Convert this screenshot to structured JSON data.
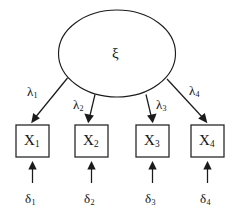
{
  "diagram": {
    "type": "path-diagram",
    "background_color": "#ffffff",
    "stroke_color": "#1b1b1b",
    "latent": {
      "symbol": "ξ",
      "shape": "ellipse",
      "cx": 117,
      "cy": 53,
      "rx": 58,
      "ry": 43
    },
    "loadings": [
      {
        "symbol": "λ",
        "sub": "1",
        "label_x": 27,
        "label_y": 85
      },
      {
        "symbol": "λ",
        "sub": "2",
        "label_x": 73,
        "label_y": 98
      },
      {
        "symbol": "λ",
        "sub": "3",
        "label_x": 156,
        "label_y": 98
      },
      {
        "symbol": "λ",
        "sub": "4",
        "label_x": 189,
        "label_y": 84
      }
    ],
    "indicators": [
      {
        "symbol": "X",
        "sub": "1",
        "box_x": 16,
        "box_y": 125,
        "box_w": 33,
        "box_h": 32
      },
      {
        "symbol": "X",
        "sub": "2",
        "box_x": 75,
        "box_y": 125,
        "box_w": 33,
        "box_h": 32
      },
      {
        "symbol": "X",
        "sub": "3",
        "box_x": 136,
        "box_y": 125,
        "box_w": 33,
        "box_h": 32
      },
      {
        "symbol": "X",
        "sub": "4",
        "box_x": 191,
        "box_y": 125,
        "box_w": 33,
        "box_h": 32
      }
    ],
    "errors": [
      {
        "symbol": "δ",
        "sub": "1",
        "label_x": 25,
        "label_y": 192
      },
      {
        "symbol": "δ",
        "sub": "2",
        "label_x": 84,
        "label_y": 192
      },
      {
        "symbol": "δ",
        "sub": "3",
        "label_x": 145,
        "label_y": 192
      },
      {
        "symbol": "δ",
        "sub": "4",
        "label_x": 200,
        "label_y": 192
      }
    ]
  }
}
